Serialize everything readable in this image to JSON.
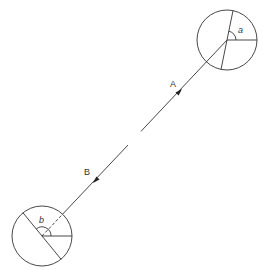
{
  "diagram": {
    "stroke_color": "#333333",
    "labels": {
      "A": "A",
      "B": "B",
      "angle_a": "a",
      "angle_b": "b"
    },
    "top_circle": {
      "cx": 227,
      "cy": 40,
      "r": 30,
      "angle_label": "a"
    },
    "bottom_circle": {
      "cx": 42,
      "cy": 236,
      "r": 30,
      "angle_label": "b"
    },
    "connector": {
      "from": [
        42,
        236
      ],
      "to": [
        227,
        40
      ],
      "gap_start": [
        128,
        144
      ],
      "gap_end": [
        141,
        131
      ],
      "arrow_A_position": [
        178,
        93
      ],
      "arrow_B_position": [
        95,
        180
      ]
    }
  }
}
